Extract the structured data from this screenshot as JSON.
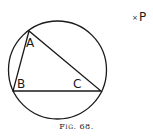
{
  "figure": {
    "caption": "Fig. 68.",
    "circle": {
      "cx": 57.5,
      "cy": 70,
      "r": 49
    },
    "vertices": {
      "A": {
        "x": 29,
        "y": 31
      },
      "B": {
        "x": 13,
        "y": 91
      },
      "C": {
        "x": 101,
        "y": 91
      }
    },
    "labels": {
      "A": "A",
      "B": "B",
      "C": "C",
      "P": "P",
      "P_marker": "×"
    },
    "stroke_color": "#1a1a1a"
  }
}
